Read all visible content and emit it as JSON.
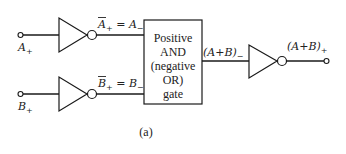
{
  "inputs": {
    "a": {
      "base": "A",
      "sub": "+"
    },
    "b": {
      "base": "B",
      "sub": "+"
    }
  },
  "inverter_outputs": {
    "a": {
      "lhs_base": "A",
      "lhs_sub": "+",
      "eq": " = ",
      "rhs_base": "A",
      "rhs_sub": "−"
    },
    "b": {
      "lhs_base": "B",
      "lhs_sub": "+",
      "eq": " = ",
      "rhs_base": "B",
      "rhs_sub": "−"
    }
  },
  "gate_box": {
    "lines": [
      "Positive",
      "AND",
      "(negative",
      "OR)",
      "gate"
    ]
  },
  "gate_output": {
    "text": "(A+B)",
    "sub": "−"
  },
  "final_output": {
    "text": "(A+B)",
    "sub": "+"
  },
  "caption": "(a)"
}
